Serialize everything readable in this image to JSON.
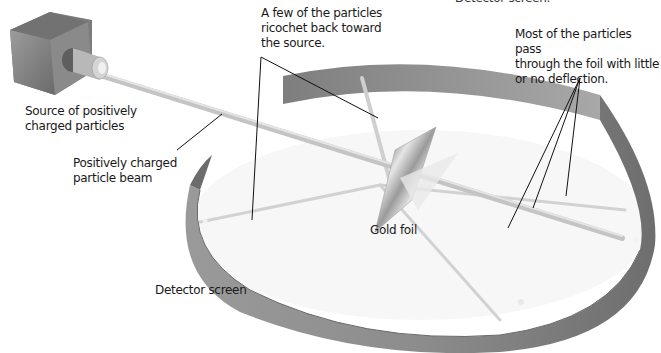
{
  "diagram": {
    "colors": {
      "background": "#ffffff",
      "screen": "#8e8e8e",
      "screen_dark": "#6f6f6f",
      "screen_light": "#b4b4b4",
      "source_block": "#8a8a8a",
      "beam": "#c9c9c9",
      "leader_line": "#111111",
      "text": "#1a1a1a"
    },
    "labels": {
      "cut_top": "Detector screen.",
      "ricochet": "A few of the particles\nricochet back toward\nthe source.",
      "pass_through": "Most of the particles pass\nthrough the foil with little\nor no deflection.",
      "source": "Source of positively\ncharged particles",
      "beam": "Positively charged\nparticle beam",
      "foil": "Gold foil",
      "detector": "Detector screen"
    },
    "components": [
      {
        "id": "source",
        "name": "Source of positively charged particles"
      },
      {
        "id": "beam",
        "name": "Positively charged particle beam"
      },
      {
        "id": "foil",
        "name": "Gold foil"
      },
      {
        "id": "detector",
        "name": "Detector screen"
      }
    ]
  }
}
